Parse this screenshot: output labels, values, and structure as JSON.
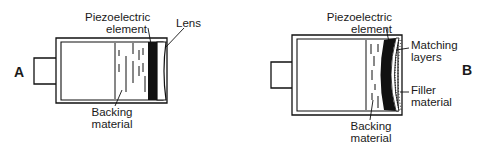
{
  "diagrams": [
    {
      "id": "A",
      "label": "A",
      "callouts": {
        "piezo_line1": "Piezoelectric",
        "piezo_line2": "element",
        "lens": "Lens",
        "backing_line1": "Backing",
        "backing_line2": "material"
      }
    },
    {
      "id": "B",
      "label": "B",
      "callouts": {
        "piezo_line1": "Piezoelectric",
        "piezo_line2": "element",
        "matching_line1": "Matching",
        "matching_line2": "layers",
        "filler_line1": "Filler",
        "filler_line2": "material",
        "backing_line1": "Backing",
        "backing_line2": "material"
      }
    }
  ],
  "colors": {
    "ink": "#111111",
    "background": "#ffffff"
  }
}
